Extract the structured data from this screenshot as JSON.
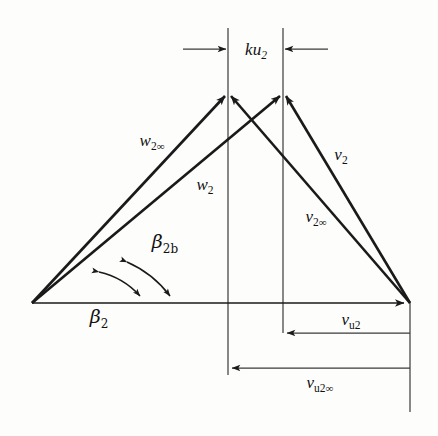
{
  "figure": {
    "kind": "velocity-triangle",
    "title_text": "",
    "background_color": "#fdfdfc",
    "line_color": "#1a1a1a",
    "thin_line_color": "#3a3a3a"
  },
  "labels": {
    "slip_gap": {
      "base": "k",
      "var": "u",
      "sub": "2",
      "full": "ku2"
    },
    "w_inf": {
      "base": "w",
      "sub": "2",
      "inf": "∞",
      "full": "w2∞"
    },
    "w": {
      "base": "w",
      "sub": "2",
      "full": "w2"
    },
    "v": {
      "base": "v",
      "sub": "2",
      "full": "v2"
    },
    "v_inf": {
      "base": "v",
      "sub": "2",
      "inf": "∞",
      "full": "v2∞"
    },
    "beta_blade": {
      "base": "β",
      "sub": "2b",
      "full": "β2b"
    },
    "beta_flow": {
      "base": "β",
      "sub": "2",
      "full": "β2"
    },
    "vu": {
      "base": "v",
      "sub": "u2",
      "full": "vu2"
    },
    "vu_inf": {
      "base": "v",
      "sub": "u2",
      "inf": "∞",
      "full": "vu2∞"
    }
  },
  "geometry": {
    "origin": {
      "x": 32,
      "y": 303
    },
    "right_vertex": {
      "x": 410,
      "y": 303
    },
    "apex_left": {
      "x": 228,
      "y": 92
    },
    "apex_right": {
      "x": 283,
      "y": 92
    },
    "guide_left_x": 228,
    "guide_right_x": 283,
    "guide_top_y": 28,
    "dim_ku2_y": 49,
    "dim_vu2_y": 333,
    "dim_vu2inf_y": 368,
    "axis_y": 303,
    "beta_blade_arc_end_x": 170,
    "beta_flow_arc_end_x": 140
  },
  "label_positions": {
    "slip_gap": {
      "x": 256,
      "y": 55
    },
    "w_inf": {
      "x": 152,
      "y": 146
    },
    "w": {
      "x": 205,
      "y": 190
    },
    "v": {
      "x": 341,
      "y": 160
    },
    "v_inf": {
      "x": 316,
      "y": 222
    },
    "beta_blade": {
      "x": 165,
      "y": 248
    },
    "beta_flow": {
      "x": 99,
      "y": 323
    },
    "vu": {
      "x": 351,
      "y": 325
    },
    "vu_inf": {
      "x": 320,
      "y": 388
    }
  }
}
